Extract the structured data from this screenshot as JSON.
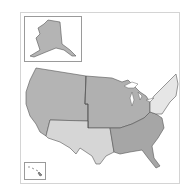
{
  "map": {
    "title": "United States regions",
    "regions": [
      {
        "id": "west",
        "name": "West",
        "color": "#b4b4b4"
      },
      {
        "id": "midwest",
        "name": "Midwest",
        "color": "#b0b0b0"
      },
      {
        "id": "southwest",
        "name": "Southwest",
        "color": "#d6d6d6"
      },
      {
        "id": "southeast",
        "name": "Southeast",
        "color": "#a6a6a6"
      },
      {
        "id": "northeast",
        "name": "Northeast",
        "color": "#e6e6e6"
      }
    ],
    "insets": [
      {
        "id": "alaska",
        "name": "Alaska",
        "color": "#b4b4b4"
      },
      {
        "id": "hawaii",
        "name": "Hawaii",
        "color": "#888888"
      }
    ]
  }
}
